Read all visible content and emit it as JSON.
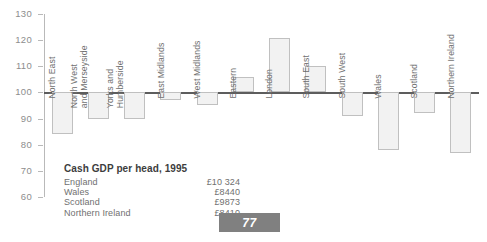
{
  "chart_data": {
    "type": "bar",
    "title": "",
    "xlabel": "",
    "ylabel": "",
    "ylim": [
      60,
      130
    ],
    "ytick_step": 10,
    "yticks": [
      130,
      120,
      110,
      100,
      90,
      80,
      70,
      60
    ],
    "baseline": 100,
    "grid": false,
    "legend": null,
    "categories": [
      "North East",
      "North West\nand Merseyside",
      "Yorks and\nHumberside",
      "East Midlands",
      "West Midlands",
      "Eastern",
      "London",
      "South East",
      "South West",
      "Wales",
      "Scotland",
      "Northern Ireland"
    ],
    "values": [
      84,
      90,
      90,
      97,
      95,
      106,
      121,
      110,
      91,
      78,
      92,
      77
    ],
    "bar_fill": "#f2f2f2",
    "bar_edge": "#c0c0c0",
    "axis_color": "#b9b9b9",
    "baseline_color": "#5d5d5d",
    "tick_label_color": "#8d8d8d"
  },
  "inset": {
    "title": "Cash GDP per head, 1995",
    "rows": [
      {
        "label": "England",
        "value": "£10 324"
      },
      {
        "label": "Wales",
        "value": "£8440"
      },
      {
        "label": "Scotland",
        "value": "£9873"
      },
      {
        "label": "Northern Ireland",
        "value": "£8410"
      }
    ]
  },
  "page": {
    "number": "77",
    "badge_color": "#808080"
  }
}
